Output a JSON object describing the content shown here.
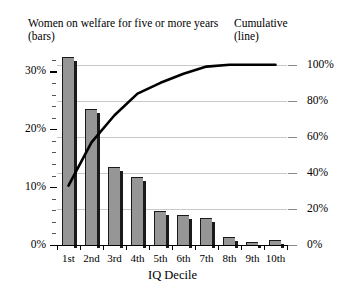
{
  "headers": {
    "left": "Women on welfare for five or more years\n(bars)",
    "right": "Cumulative\n(line)"
  },
  "axes": {
    "x_title": "IQ Decile",
    "left_ticks": [
      "0%",
      "10%",
      "20%",
      "30%"
    ],
    "right_ticks": [
      "0%",
      "20%",
      "40%",
      "60%",
      "80%",
      "100%"
    ]
  },
  "colors": {
    "bar_fill": "#969696",
    "bar_edge": "#1a1a1a",
    "line": "#000000",
    "gridline": "#c9c9c9",
    "background": "#ffffff"
  },
  "chart_data": {
    "type": "bar",
    "title": "Women on welfare for five or more years (bars)",
    "subtitle": "Cumulative (line)",
    "xlabel": "IQ Decile",
    "ylabel": "Women on welfare for five or more years",
    "y2label": "Cumulative",
    "categories": [
      "1st",
      "2nd",
      "3rd",
      "4th",
      "5th",
      "6th",
      "7th",
      "8th",
      "9th",
      "10th"
    ],
    "ylim": [
      0,
      33
    ],
    "y2lim": [
      0,
      106
    ],
    "grid": true,
    "legend": "none",
    "series": [
      {
        "name": "Women on welfare for five or more years",
        "type": "bar",
        "axis": "left",
        "unit": "%",
        "values": [
          32.5,
          23.5,
          13.5,
          11.8,
          5.8,
          5.2,
          4.7,
          1.3,
          0.5,
          0.8
        ]
      },
      {
        "name": "Cumulative",
        "type": "line",
        "axis": "right",
        "unit": "%",
        "values": [
          33,
          57,
          72,
          84,
          90,
          95,
          99,
          100,
          100,
          100
        ]
      }
    ]
  }
}
